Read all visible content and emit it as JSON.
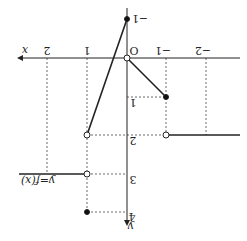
{
  "figure": {
    "orientation": "rotated-180",
    "function_label": "y=f(x)",
    "axis_x_label": "x",
    "axis_y_label": "y",
    "origin_label": "O",
    "x_ticks": [
      {
        "value": 2,
        "label": "2"
      },
      {
        "value": 1,
        "label": "1"
      },
      {
        "value": -1,
        "label": "−1"
      },
      {
        "value": -2,
        "label": "−2"
      }
    ],
    "y_ticks": [
      {
        "value": -1,
        "label": "−1"
      },
      {
        "value": 1,
        "label": "1"
      },
      {
        "value": 2,
        "label": "2"
      },
      {
        "value": 3,
        "label": "3"
      },
      {
        "value": 4,
        "label": "4"
      }
    ],
    "pieces": [
      {
        "domain": "x < -1",
        "value": 2,
        "endpoint_at_-1": "open"
      },
      {
        "domain": "-1 <= x < 0",
        "from": [
          -1,
          1
        ],
        "to": [
          0,
          0
        ],
        "left": "closed",
        "right": "open"
      },
      {
        "domain": "0 <= x < 1",
        "from": [
          0,
          -1
        ],
        "to": [
          1,
          2
        ],
        "left": "closed",
        "right": "open"
      },
      {
        "domain": "x > 1",
        "value": 3,
        "endpoint_at_1": "open"
      },
      {
        "point": [
          1,
          4
        ],
        "type": "closed"
      }
    ],
    "colors": {
      "line": "#222222",
      "dash": "#444444",
      "background": "#ffffff"
    }
  }
}
